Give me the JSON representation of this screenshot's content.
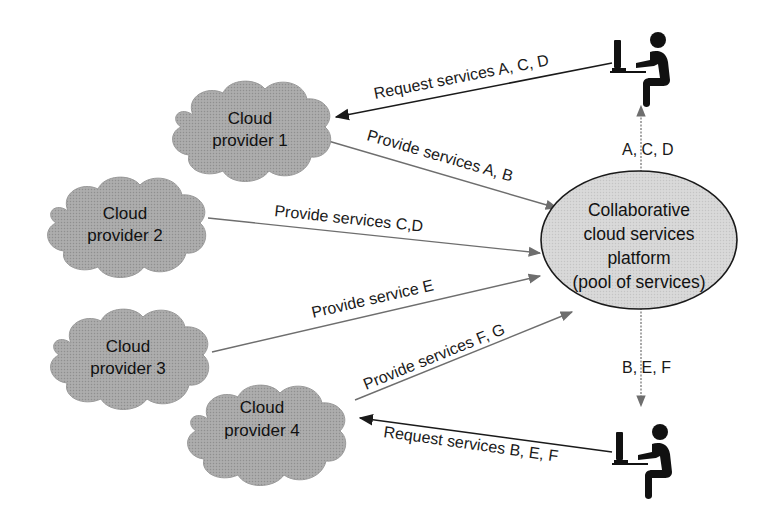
{
  "diagram": {
    "platform": {
      "lines": [
        "Collaborative",
        "cloud services",
        "platform",
        "(pool of services)"
      ]
    },
    "providers": [
      {
        "lines": [
          "Cloud",
          "provider 1"
        ]
      },
      {
        "lines": [
          "Cloud",
          "provider 2"
        ]
      },
      {
        "lines": [
          "Cloud",
          "provider 3"
        ]
      },
      {
        "lines": [
          "Cloud",
          "provider 4"
        ]
      }
    ],
    "edges": {
      "request_top": "Request services A, C, D",
      "provide_1": "Provide services A, B",
      "provide_2": "Provide services C,D",
      "provide_3": "Provide service E",
      "provide_4": "Provide services F, G",
      "request_bottom": "Request services B, E, F",
      "deliver_top": "A, C, D",
      "deliver_bottom": "B, E, F"
    },
    "icons": {
      "user_top": "user-at-computer-icon",
      "user_bottom": "user-at-computer-icon"
    },
    "colors": {
      "cloud_fill": "#a9a9a9",
      "platform_fill": "#d4d4d4",
      "provide_arrow": "#6e6e6e",
      "request_arrow": "#1a1a1a",
      "figure": "#111111"
    }
  }
}
